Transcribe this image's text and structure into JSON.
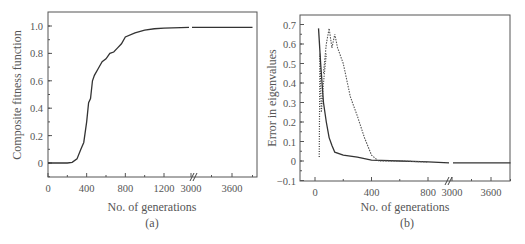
{
  "chart_data": [
    {
      "panel": "(a)",
      "type": "line",
      "title": "",
      "xlabel": "No. of generations",
      "ylabel": "Composite fitness function",
      "x_ticks": [
        "0",
        "400",
        "800",
        "1200",
        "3000",
        "3600"
      ],
      "y_ticks": [
        "0",
        "0.2",
        "0.4",
        "0.6",
        "0.8",
        "1.0"
      ],
      "ylim": [
        -0.1,
        1.1
      ],
      "x_axis_break": "between 1200 and 3000",
      "grid": false,
      "legend": null,
      "series": [
        {
          "name": "fitness",
          "style": "solid",
          "x": [
            0,
            100,
            200,
            250,
            300,
            340,
            370,
            400,
            420,
            440,
            460,
            480,
            520,
            560,
            600,
            640,
            680,
            720,
            760,
            800,
            900,
            1000,
            1100,
            1200,
            3000,
            3600,
            3900
          ],
          "y": [
            0,
            0,
            0,
            0.005,
            0.03,
            0.1,
            0.15,
            0.3,
            0.44,
            0.47,
            0.6,
            0.64,
            0.69,
            0.74,
            0.76,
            0.8,
            0.81,
            0.84,
            0.87,
            0.92,
            0.95,
            0.97,
            0.98,
            0.985,
            0.99,
            0.99,
            0.99
          ]
        }
      ]
    },
    {
      "panel": "(b)",
      "type": "line",
      "title": "",
      "xlabel": "No. of generations",
      "ylabel": "Error in eigenvalues",
      "x_ticks": [
        "0",
        "400",
        "800",
        "3000",
        "3600"
      ],
      "y_ticks": [
        "-0.1",
        "0",
        "0.1",
        "0.2",
        "0.3",
        "0.4",
        "0.5",
        "0.6",
        "0.7"
      ],
      "ylim": [
        -0.1,
        0.72
      ],
      "x_axis_break": "between 800 and 3000",
      "grid": false,
      "legend": null,
      "series": [
        {
          "name": "error-solid",
          "style": "solid",
          "x": [
            25,
            40,
            60,
            80,
            100,
            120,
            140,
            200,
            300,
            400,
            600,
            800,
            3000,
            3600,
            3900
          ],
          "y": [
            0.68,
            0.5,
            0.3,
            0.2,
            0.12,
            0.08,
            0.045,
            0.03,
            0.02,
            0.005,
            0.0,
            -0.005,
            -0.01,
            -0.01,
            -0.01
          ]
        },
        {
          "name": "error-dotted-1",
          "style": "dotted",
          "x": [
            30,
            35,
            45,
            60,
            80
          ],
          "y": [
            0.02,
            0.55,
            0.25,
            0.4,
            0.55
          ]
        },
        {
          "name": "error-dotted-2",
          "style": "dashed-dotted",
          "x": [
            60,
            80,
            100,
            120,
            140,
            160,
            200,
            250,
            300,
            350,
            400,
            450,
            600,
            800
          ],
          "y": [
            0.45,
            0.6,
            0.68,
            0.58,
            0.65,
            0.58,
            0.5,
            0.33,
            0.23,
            0.12,
            0.03,
            0.0,
            0.0,
            -0.005
          ]
        }
      ]
    }
  ]
}
